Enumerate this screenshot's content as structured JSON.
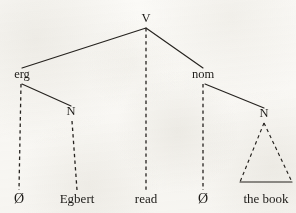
{
  "diagram": {
    "type": "syntax-tree",
    "canvas": {
      "width": 296,
      "height": 213
    },
    "ink_color": "#26231f",
    "paper_color": "#fbfaf7"
  },
  "nodes": {
    "root": {
      "label": "V",
      "x": 146,
      "y": 22,
      "kind": "category"
    },
    "erg": {
      "label": "erg",
      "x": 22,
      "y": 78,
      "kind": "category"
    },
    "nom": {
      "label": "nom",
      "x": 203,
      "y": 78,
      "kind": "category"
    },
    "n_left": {
      "label": "N",
      "x": 71,
      "y": 115,
      "kind": "category"
    },
    "n_right": {
      "label": "N",
      "x": 264,
      "y": 117,
      "kind": "category"
    }
  },
  "terminals": [
    {
      "id": "t_null_left",
      "label": "Ø",
      "x": 19,
      "y": 203,
      "kind": "null"
    },
    {
      "id": "t_egbert",
      "label": "Egbert",
      "x": 77,
      "y": 203,
      "kind": "word"
    },
    {
      "id": "t_read",
      "label": "read",
      "x": 146,
      "y": 203,
      "kind": "word"
    },
    {
      "id": "t_null_right",
      "label": "Ø",
      "x": 203,
      "y": 203,
      "kind": "null"
    },
    {
      "id": "t_the_book",
      "label": "the book",
      "x": 266,
      "y": 203,
      "kind": "phrase"
    }
  ],
  "edges": [
    {
      "id": "e-root-erg",
      "from": "root",
      "to": "erg",
      "style": "solid",
      "x1": 146,
      "y1": 28,
      "x2": 22,
      "y2": 68
    },
    {
      "id": "e-root-read",
      "from": "root",
      "to": "t_read",
      "style": "dashed",
      "x1": 146,
      "y1": 28,
      "x2": 146,
      "y2": 190
    },
    {
      "id": "e-root-nom",
      "from": "root",
      "to": "nom",
      "style": "solid",
      "x1": 146,
      "y1": 28,
      "x2": 203,
      "y2": 68
    },
    {
      "id": "e-erg-null",
      "from": "erg",
      "to": "t_null_left",
      "style": "dashed",
      "x1": 21,
      "y1": 84,
      "x2": 19,
      "y2": 190
    },
    {
      "id": "e-erg-n",
      "from": "erg",
      "to": "n_left",
      "style": "solid",
      "x1": 22,
      "y1": 84,
      "x2": 71,
      "y2": 106
    },
    {
      "id": "e-n-egbert",
      "from": "n_left",
      "to": "t_egbert",
      "style": "dashed",
      "x1": 72,
      "y1": 121,
      "x2": 77,
      "y2": 190
    },
    {
      "id": "e-nom-null",
      "from": "nom",
      "to": "t_null_right",
      "style": "dashed",
      "x1": 203,
      "y1": 84,
      "x2": 203,
      "y2": 190
    },
    {
      "id": "e-nom-n",
      "from": "nom",
      "to": "n_right",
      "style": "solid",
      "x1": 205,
      "y1": 84,
      "x2": 264,
      "y2": 108
    }
  ],
  "triangles": [
    {
      "id": "tri-the-book",
      "for": "t_the_book",
      "apex_x": 264,
      "apex_y": 123,
      "left_x": 240,
      "right_x": 292,
      "base_y": 182,
      "side_style": "dashed",
      "base_style": "solid"
    }
  ],
  "labels_flat": [
    "V",
    "erg",
    "nom",
    "N",
    "N",
    "Ø",
    "Egbert",
    "read",
    "Ø",
    "the book"
  ]
}
